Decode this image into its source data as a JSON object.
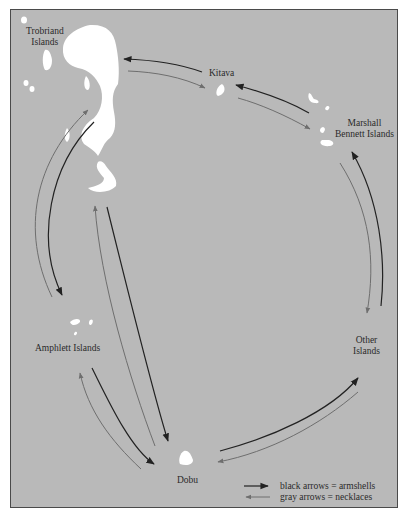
{
  "map": {
    "title": "Kula ring exchange",
    "background_color": "#b9b9b9",
    "island_color": "#ffffff",
    "places": [
      {
        "id": "trobriand",
        "label_line1": "Trobriand",
        "label_line2": "Islands"
      },
      {
        "id": "kitava",
        "label_line1": "Kitava"
      },
      {
        "id": "marshall-bennett",
        "label_line1": "Marshall",
        "label_line2": "Bennett Islands"
      },
      {
        "id": "other",
        "label_line1": "Other",
        "label_line2": "Islands"
      },
      {
        "id": "dobu",
        "label_line1": "Dobu"
      },
      {
        "id": "amphlett",
        "label_line1": "Amphlett Islands"
      }
    ],
    "arrow_colors": {
      "armshells": "#222222",
      "necklaces": "#6e6e6e"
    }
  },
  "legend": {
    "black": "black arrows = armshells",
    "gray": "gray arrows = necklaces"
  }
}
